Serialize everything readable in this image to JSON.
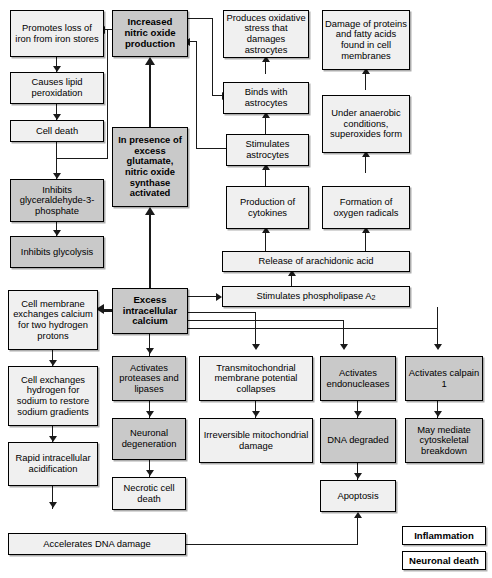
{
  "diagram": {
    "colors": {
      "inflammation_fill": "#f0f0f0",
      "neuronal_death_fill": "#c9c9c9",
      "border": "#000000",
      "arrow": "#1a1a1a",
      "background": "#ffffff"
    },
    "nodes": {
      "promotes_loss_iron": "Promotes loss of iron from iron stores",
      "causes_lipid_perox": "Causes lipid peroxidation",
      "cell_death": "Cell death",
      "inhibits_g3p": "Inhibits glyceraldehyde-3-phosphate",
      "inhibits_glycolysis": "Inhibits glycolysis",
      "increased_no": "Increased nitric oxide production",
      "in_presence_glutamate": "In presence of excess glutamate, nitric oxide synthase activated",
      "produces_oxidative_stress": "Produces oxidative stress that damages astrocytes",
      "binds_astrocytes": "Binds with astrocytes",
      "stimulates_astrocytes": "Stimulates astrocytes",
      "production_cytokines": "Production of cytokines",
      "damage_proteins": "Damage of proteins and fatty acids found in cell membranes",
      "under_anaerobic": "Under anaerobic conditions, superoxides form",
      "formation_oxygen_radicals": "Formation of oxygen radicals",
      "release_arachidonic": "Release of arachidonic acid",
      "excess_calcium": "Excess intracellular calcium",
      "stimulates_pla2_pre": "Stimulates phospholipase A",
      "stimulates_pla2_sub": "2",
      "cell_membrane_exchanges": "Cell membrane exchanges calcium for two hydrogen protons",
      "cell_exchanges_hydrogen": "Cell exchanges hydrogen for sodium to restore sodium gradients",
      "rapid_acidification": "Rapid intracellular acidification",
      "accelerates_dna_damage": "Accelerates DNA damage",
      "activates_proteases": "Activates proteases and lipases",
      "neuronal_degeneration": "Neuronal degeneration",
      "necrotic_cell_death": "Necrotic cell death",
      "transmitochondrial": "Transmitochondrial membrane potential collapses",
      "irreversible_mito": "Irreversible mitochondrial damage",
      "activates_endonucleases": "Activates endonucleases",
      "dna_degraded": "DNA degraded",
      "apoptosis": "Apoptosis",
      "activates_calpain": "Activates calpain 1",
      "may_mediate_cyto": "May mediate cytoskeletal breakdown"
    },
    "legend": {
      "inflammation": "Inflammation",
      "neuronal_death": "Neuronal death"
    }
  }
}
